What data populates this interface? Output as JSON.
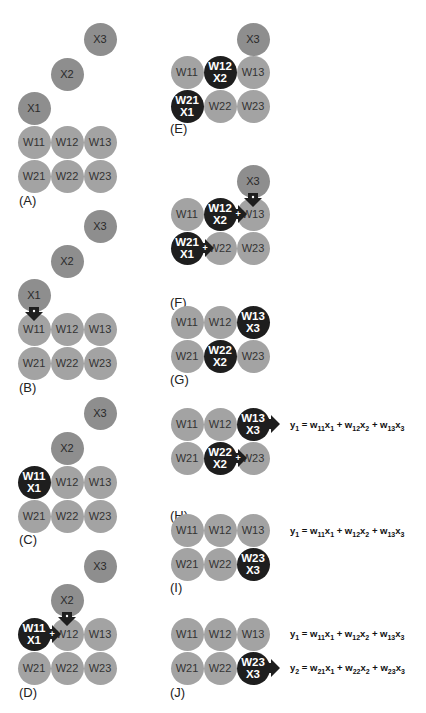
{
  "panels": [
    {
      "id": "A",
      "label": "(A)"
    },
    {
      "id": "B",
      "label": "(B)"
    },
    {
      "id": "C",
      "label": "(C)"
    },
    {
      "id": "D",
      "label": "(D)"
    },
    {
      "id": "E",
      "label": "(E)"
    },
    {
      "id": "F",
      "label": "(F)"
    },
    {
      "id": "G",
      "label": "(G)"
    },
    {
      "id": "H",
      "label": "(H)"
    },
    {
      "id": "I",
      "label": "(I)"
    },
    {
      "id": "J",
      "label": "(J)"
    }
  ],
  "cells": {
    "W11": "W11",
    "W12": "W12",
    "W13": "W13",
    "W21": "W21",
    "W22": "W22",
    "W23": "W23",
    "X1": "X1",
    "X2": "X2",
    "X3": "X3"
  },
  "equations": {
    "y1": {
      "lhs": "y",
      "lhs_sub": "1",
      "terms": [
        [
          "w",
          "11",
          "x",
          "1"
        ],
        [
          "w",
          "12",
          "x",
          "2"
        ],
        [
          "w",
          "13",
          "x",
          "3"
        ]
      ]
    },
    "y2": {
      "lhs": "y",
      "lhs_sub": "2",
      "terms": [
        [
          "w",
          "21",
          "x",
          "1"
        ],
        [
          "w",
          "22",
          "x",
          "2"
        ],
        [
          "w",
          "23",
          "x",
          "3"
        ]
      ]
    }
  },
  "colors": {
    "cell": "#a3a3a3",
    "input": "#8e8e8e",
    "active": "#1e1e1e",
    "background": "#ffffff"
  }
}
